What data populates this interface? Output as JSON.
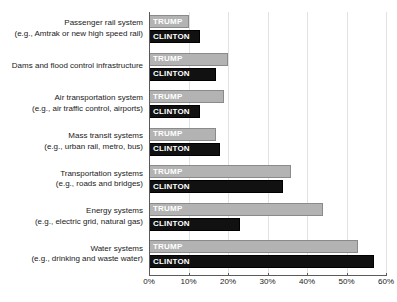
{
  "chart_data": {
    "type": "bar",
    "orientation": "horizontal",
    "title": "",
    "subtitle": "",
    "xlabel": "",
    "ylabel": "",
    "xlim": [
      0,
      60
    ],
    "xticks": [
      0,
      10,
      20,
      30,
      40,
      50,
      60
    ],
    "xtick_labels": [
      "0%",
      "10%",
      "20%",
      "30%",
      "40%",
      "50%",
      "60%"
    ],
    "grid": true,
    "grid_axis": "x",
    "legend": "in-bar-labels",
    "legend_position": "none",
    "categories": [
      "Passenger rail system (e.g., Amtrak or new high speed rail)",
      "Dams and flood control infrastructure",
      "Air transportation system (e.g., air traffic control, airports)",
      "Mass transit systems (e.g., urban rail, metro, bus)",
      "Transportation systems (e.g., roads and bridges)",
      "Energy systems (e.g., electric grid, natural gas)",
      "Water systems (e.g., drinking and waste water)"
    ],
    "category_lines": [
      [
        "Passenger rail system",
        "(e.g., Amtrak or new high speed rail)"
      ],
      [
        "Dams and flood control infrastructure"
      ],
      [
        "Air transportation system",
        "(e.g., air traffic control, airports)"
      ],
      [
        "Mass transit systems",
        "(e.g., urban rail, metro, bus)"
      ],
      [
        "Transportation systems",
        "(e.g., roads and bridges)"
      ],
      [
        "Energy systems",
        "(e.g., electric grid, natural gas)"
      ],
      [
        "Water systems",
        "(e.g., drinking and waste water)"
      ]
    ],
    "series": [
      {
        "name": "TRUMP",
        "color": "#b3b3b3",
        "text_color": "#ffffff",
        "values": [
          10,
          20,
          19,
          17,
          36,
          44,
          53
        ]
      },
      {
        "name": "CLINTON",
        "color": "#111111",
        "text_color": "#ffffff",
        "values": [
          13,
          17,
          13,
          18,
          34,
          23,
          57
        ]
      }
    ]
  },
  "colors": {
    "trump": "#b3b3b3",
    "clinton": "#111111",
    "grid": "#e2e2e2",
    "axis": "#5a5a5a",
    "background": "#ffffff",
    "text": "#1a1a1a"
  }
}
